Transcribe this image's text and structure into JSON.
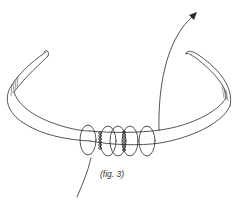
{
  "figure": {
    "caption": "(fig. 3)",
    "ink_color": "#2a2a2a",
    "background": "#ffffff",
    "parts": {
      "headband": "headband-outline",
      "loops_count": 5,
      "stitch_columns": 2,
      "arrow": "arrow-up-right-icon",
      "tail": "thread-tail"
    }
  }
}
